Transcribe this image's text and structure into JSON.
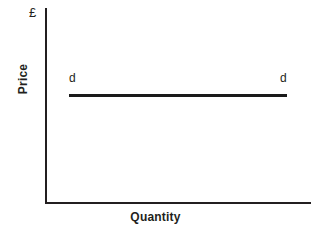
{
  "figure": {
    "background_color": "#ffffff",
    "line_color": "#231f20",
    "curve_color": "#1a1a1a",
    "width": 311,
    "height": 228
  },
  "axes": {
    "y_title": "Price",
    "x_title": "Quantity",
    "currency_symbol": "£"
  },
  "curve": {
    "label_left": "d",
    "label_right": "d"
  },
  "chart_data": {
    "type": "line",
    "title": "",
    "subtitle": "",
    "xlabel": "Quantity",
    "ylabel": "Price",
    "ylabel_unit": "£",
    "grid": false,
    "legend": false,
    "legend_position": "none",
    "axis_ticks": {
      "x": [],
      "y": []
    },
    "xlim": [
      0,
      100
    ],
    "ylim": [
      0,
      100
    ],
    "series": [
      {
        "name": "d",
        "description": "Perfectly elastic demand curve (horizontal line at a constant price)",
        "color": "#1a1a1a",
        "x": [
          11,
          100
        ],
        "y": [
          55,
          55
        ]
      }
    ],
    "annotations": [
      {
        "text": "d",
        "x": 11,
        "y": 63,
        "series": "d",
        "position": "left-end"
      },
      {
        "text": "d",
        "x": 99,
        "y": 63,
        "series": "d",
        "position": "right-end"
      },
      {
        "text": "£",
        "x": 0,
        "y": 100,
        "position": "y-axis-top"
      }
    ]
  }
}
